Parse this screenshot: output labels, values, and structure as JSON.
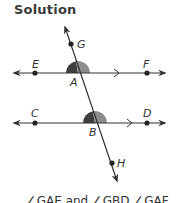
{
  "title": "Solution",
  "figure": {
    "lines": [
      {
        "name": "line-EF",
        "points": [
          "E",
          "F"
        ],
        "parallel_mark": ">"
      },
      {
        "name": "line-CD",
        "points": [
          "C",
          "D"
        ],
        "parallel_mark": ">"
      },
      {
        "name": "transversal-GH",
        "points": [
          "G",
          "A",
          "B",
          "H"
        ]
      }
    ],
    "labels": {
      "E": "E",
      "F": "F",
      "G": "G",
      "A": "A",
      "C": "C",
      "D": "D",
      "B": "B",
      "H": "H"
    },
    "angle_marks": [
      {
        "vertex": "A",
        "left_color": "#3f3f3f",
        "right_color": "#8c8c8c"
      },
      {
        "vertex": "B",
        "left_color": "#3f3f3f",
        "right_color": "#8c8c8c"
      }
    ],
    "line_color": "#333333"
  },
  "caption": "∠GAE and ∠GBD ∠GAF"
}
